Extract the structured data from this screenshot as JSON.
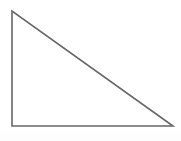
{
  "figure": {
    "kind": "geometry-figure",
    "canvas": {
      "width": 181,
      "height": 141,
      "background_color": "#ffffff"
    },
    "shape": {
      "name": "right-triangle",
      "filled": false,
      "fill_color": "none",
      "stroke_color": "#5a5a5a",
      "stroke_width": 1.6,
      "right_angle_at": "bottom-left",
      "vertices": [
        {
          "label": "apex",
          "x": 12,
          "y": 11
        },
        {
          "label": "bottom-left",
          "x": 12,
          "y": 126
        },
        {
          "label": "bottom-right",
          "x": 173,
          "y": 126
        }
      ],
      "points_attr": "12,11 12,126 173,126",
      "edges": [
        {
          "name": "vertical-leg",
          "from": "apex",
          "to": "bottom-left",
          "length_px": 115
        },
        {
          "name": "horizontal-leg",
          "from": "bottom-left",
          "to": "bottom-right",
          "length_px": 161
        },
        {
          "name": "hypotenuse",
          "from": "bottom-right",
          "to": "apex",
          "length_px": 198
        }
      ]
    },
    "labels": [],
    "annotations": []
  }
}
